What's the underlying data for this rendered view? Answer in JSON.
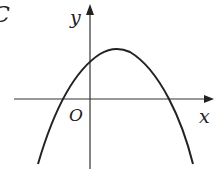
{
  "figure": {
    "panel_label": "C",
    "x_axis_label": "x",
    "y_axis_label": "y",
    "origin_label": "O",
    "curve": "downward-opening parabola"
  },
  "colors": {
    "line": "#222222",
    "background": "#ffffff"
  }
}
